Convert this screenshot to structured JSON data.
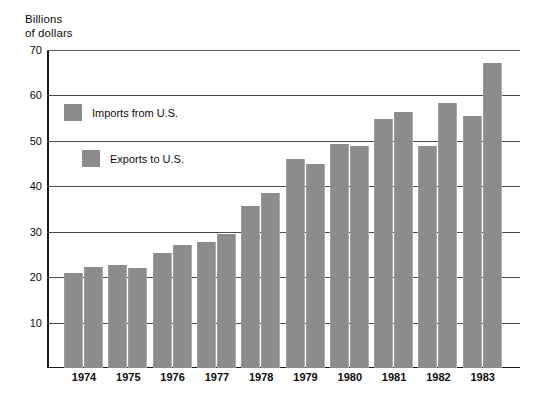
{
  "chart_data": {
    "type": "bar",
    "title": "",
    "ylabel": "Billions\nof dollars",
    "xlabel": "",
    "ylim": [
      0,
      70
    ],
    "yticks": [
      70,
      60,
      50,
      40,
      30,
      20,
      10
    ],
    "grid": true,
    "legend_position": "inside-upper-left",
    "categories": [
      "1974",
      "1975",
      "1976",
      "1977",
      "1978",
      "1979",
      "1980",
      "1981",
      "1982",
      "1983"
    ],
    "series": [
      {
        "name": "Imports from U.S.",
        "color": "#8c8c8c",
        "values": [
          21.0,
          22.7,
          25.3,
          27.8,
          35.6,
          46.1,
          49.3,
          54.9,
          48.9,
          55.5
        ]
      },
      {
        "name": "Exports to U.S.",
        "color": "#8c8c8c",
        "values": [
          22.3,
          22.0,
          27.1,
          29.5,
          38.5,
          45.0,
          48.9,
          56.3,
          58.3,
          67.2
        ]
      }
    ]
  },
  "axis": {
    "y_title_line1": "Billions",
    "y_title_line2": "of dollars"
  },
  "colors": {
    "bar_fill": "#8c8c8c",
    "axis": "#1a1a1a",
    "gridline": "#4a4a4a",
    "text": "#0d0d0d",
    "background": "#ffffff"
  }
}
